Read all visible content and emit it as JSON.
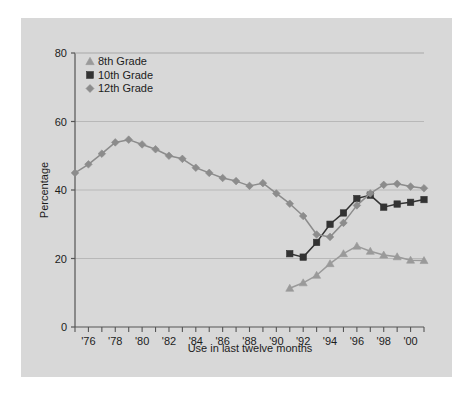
{
  "chart_data": {
    "type": "line",
    "title": "",
    "xlabel": "Use in last twelve months",
    "ylabel": "Percentage",
    "xlim": [
      1975,
      2001
    ],
    "ylim": [
      0,
      80
    ],
    "yticks": [
      0,
      20,
      40,
      60,
      80
    ],
    "ytick_labels": [
      "0",
      "20",
      "40",
      "60",
      "80"
    ],
    "xticks": [
      1976,
      1978,
      1980,
      1982,
      1984,
      1986,
      1988,
      1990,
      1992,
      1994,
      1996,
      1998,
      2000
    ],
    "xtick_labels": [
      "'76",
      "'78",
      "'80",
      "'82",
      "'84",
      "'86",
      "'88",
      "'90",
      "'92",
      "'94",
      "'96",
      "'98",
      "'00"
    ],
    "grid": true,
    "grid_axis": "y",
    "legend_position": "top-left",
    "series": [
      {
        "name": "8th Grade",
        "marker": "triangle",
        "color": "#9a9a9a",
        "x": [
          1991,
          1992,
          1993,
          1994,
          1995,
          1996,
          1997,
          1998,
          1999,
          2000,
          2001
        ],
        "values": [
          11.3,
          12.9,
          15.1,
          18.5,
          21.4,
          23.6,
          22.1,
          21.0,
          20.5,
          19.5,
          19.4
        ]
      },
      {
        "name": "10th Grade",
        "marker": "square",
        "color": "#333333",
        "x": [
          1991,
          1992,
          1993,
          1994,
          1995,
          1996,
          1997,
          1998,
          1999,
          2000,
          2001
        ],
        "values": [
          21.4,
          20.4,
          24.7,
          30.0,
          33.3,
          37.5,
          38.5,
          35.0,
          35.9,
          36.4,
          37.2
        ]
      },
      {
        "name": "12th Grade",
        "marker": "diamond",
        "color": "#8c8c8c",
        "x": [
          1975,
          1976,
          1977,
          1978,
          1979,
          1980,
          1981,
          1982,
          1983,
          1984,
          1985,
          1986,
          1987,
          1988,
          1989,
          1990,
          1991,
          1992,
          1993,
          1994,
          1995,
          1996,
          1997,
          1998,
          1999,
          2000,
          2001
        ],
        "values": [
          45.0,
          47.5,
          50.6,
          53.9,
          54.7,
          53.3,
          51.9,
          50.0,
          49.1,
          46.5,
          45.0,
          43.5,
          42.6,
          41.2,
          42.0,
          39.0,
          36.0,
          32.4,
          27.0,
          26.3,
          30.4,
          35.5,
          39.0,
          41.5,
          41.8,
          41.0,
          40.5
        ]
      }
    ]
  },
  "legend": {
    "items": [
      {
        "label": "8th Grade"
      },
      {
        "label": "10th Grade"
      },
      {
        "label": "12th Grade"
      }
    ]
  },
  "colors": {
    "panel_background": "#d8d8d8",
    "grid": "#b8b8b8",
    "axis": "#555555",
    "text": "#1c1c1c"
  }
}
